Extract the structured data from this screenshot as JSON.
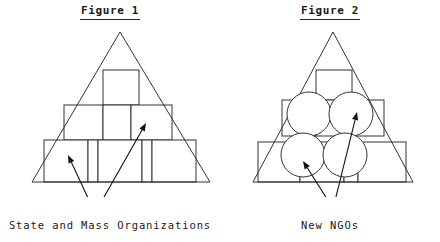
{
  "page": {
    "background_color": "#ffffff",
    "stroke_color": "#333333",
    "text_color": "#1a1a1a",
    "width": 440,
    "height": 242
  },
  "figures": [
    {
      "id": "figure-1",
      "title": "Figure 1",
      "caption": "State and Mass Organizations",
      "triangle": {
        "apex_x": 120,
        "apex_y": 10,
        "left_x": 32,
        "right_x": 210,
        "base_y": 160
      },
      "boxes": [
        {
          "label": "top-box",
          "x": 103,
          "y": 48,
          "w": 36,
          "h": 35
        },
        {
          "label": "middle-box-left",
          "x": 64,
          "y": 83,
          "w": 39,
          "h": 35
        },
        {
          "label": "middle-box-center",
          "x": 103,
          "y": 83,
          "w": 28,
          "h": 35
        },
        {
          "label": "middle-box-right",
          "x": 131,
          "y": 83,
          "w": 41,
          "h": 35
        },
        {
          "label": "bottom-box-1",
          "x": 44,
          "y": 118,
          "w": 44,
          "h": 42
        },
        {
          "label": "bottom-box-2",
          "x": 88,
          "y": 118,
          "w": 10,
          "h": 42
        },
        {
          "label": "bottom-box-3",
          "x": 98,
          "y": 118,
          "w": 44,
          "h": 42
        },
        {
          "label": "bottom-box-4",
          "x": 142,
          "y": 118,
          "w": 10,
          "h": 42
        },
        {
          "label": "bottom-box-5",
          "x": 152,
          "y": 118,
          "w": 44,
          "h": 42
        }
      ],
      "circles": [],
      "arrows": [
        {
          "label": "arrow-to-bottom-box",
          "from_x": 95,
          "from_y": 191,
          "to_x": 68,
          "to_y": 133
        },
        {
          "label": "arrow-to-middle-box",
          "from_x": 95,
          "from_y": 191,
          "to_x": 146,
          "to_y": 101
        }
      ]
    },
    {
      "id": "figure-2",
      "title": "Figure 2",
      "caption": "New NGOs",
      "triangle": {
        "apex_x": 113,
        "apex_y": 10,
        "left_x": 33,
        "right_x": 193,
        "base_y": 160
      },
      "boxes": [
        {
          "label": "top-box",
          "x": 96,
          "y": 48,
          "w": 36,
          "h": 30
        },
        {
          "label": "middle-box-left",
          "x": 62,
          "y": 78,
          "w": 34,
          "h": 36
        },
        {
          "label": "middle-box-center",
          "x": 96,
          "y": 78,
          "w": 30,
          "h": 36
        },
        {
          "label": "middle-box-right",
          "x": 126,
          "y": 78,
          "w": 38,
          "h": 36
        },
        {
          "label": "bottom-box-1",
          "x": 38,
          "y": 120,
          "w": 42,
          "h": 40
        },
        {
          "label": "bottom-box-2",
          "x": 80,
          "y": 120,
          "w": 44,
          "h": 40
        },
        {
          "label": "bottom-box-3",
          "x": 124,
          "y": 120,
          "w": 14,
          "h": 40
        },
        {
          "label": "bottom-box-4",
          "x": 138,
          "y": 120,
          "w": 48,
          "h": 40
        }
      ],
      "circles": [
        {
          "label": "circle-upper-left",
          "cx": 89,
          "cy": 92,
          "r": 22
        },
        {
          "label": "circle-upper-right",
          "cx": 131,
          "cy": 92,
          "r": 22
        },
        {
          "label": "circle-lower-left",
          "cx": 83,
          "cy": 133,
          "r": 22
        },
        {
          "label": "circle-lower-right",
          "cx": 125,
          "cy": 133,
          "r": 22
        }
      ],
      "arrows": [
        {
          "label": "arrow-to-lower-left-circle",
          "from_x": 116,
          "from_y": 191,
          "to_x": 83,
          "to_y": 139
        },
        {
          "label": "arrow-to-upper-right-circle",
          "from_x": 112,
          "from_y": 191,
          "to_x": 137,
          "to_y": 90
        }
      ]
    }
  ]
}
